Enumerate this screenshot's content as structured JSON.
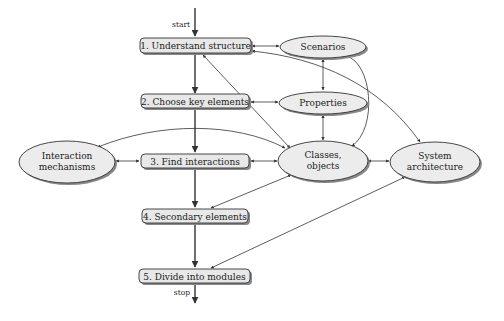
{
  "diagram": {
    "flow_labels": {
      "start": "start",
      "stop": "stop"
    },
    "steps": [
      {
        "id": "step1",
        "label": "1. Understand structure"
      },
      {
        "id": "step2",
        "label": "2. Choose key elements"
      },
      {
        "id": "step3",
        "label": "3. Find interactions"
      },
      {
        "id": "step4",
        "label": "4. Secondary elements"
      },
      {
        "id": "step5",
        "label": "5. Divide into modules"
      }
    ],
    "concepts": [
      {
        "id": "scenarios",
        "lines": [
          "Scenarios"
        ]
      },
      {
        "id": "properties",
        "lines": [
          "Properties"
        ]
      },
      {
        "id": "classes",
        "lines": [
          "Classes,",
          "objects"
        ]
      },
      {
        "id": "system",
        "lines": [
          "System",
          "architecture"
        ]
      },
      {
        "id": "interaction",
        "lines": [
          "Interaction",
          "mechanisms"
        ]
      }
    ],
    "edges": [
      {
        "from": "start",
        "to": "step1",
        "type": "main"
      },
      {
        "from": "step1",
        "to": "step2",
        "type": "main"
      },
      {
        "from": "step2",
        "to": "step3",
        "type": "main"
      },
      {
        "from": "step3",
        "to": "step4",
        "type": "main"
      },
      {
        "from": "step4",
        "to": "step5",
        "type": "main"
      },
      {
        "from": "step5",
        "to": "stop",
        "type": "main"
      },
      {
        "from": "step1",
        "to": "scenarios",
        "type": "bidirectional"
      },
      {
        "from": "step2",
        "to": "properties",
        "type": "bidirectional"
      },
      {
        "from": "step3",
        "to": "classes",
        "type": "bidirectional"
      },
      {
        "from": "interaction",
        "to": "step3",
        "type": "bidirectional"
      },
      {
        "from": "scenarios",
        "to": "properties",
        "type": "bidirectional"
      },
      {
        "from": "properties",
        "to": "classes",
        "type": "bidirectional"
      },
      {
        "from": "scenarios",
        "to": "classes",
        "type": "bidirectional-curve"
      },
      {
        "from": "step1",
        "to": "classes",
        "type": "bidirectional"
      },
      {
        "from": "step1",
        "to": "system",
        "type": "bidirectional-curve"
      },
      {
        "from": "interaction",
        "to": "classes",
        "type": "bidirectional-curve"
      },
      {
        "from": "classes",
        "to": "system",
        "type": "bidirectional"
      },
      {
        "from": "classes",
        "to": "step4",
        "type": "bidirectional"
      },
      {
        "from": "system",
        "to": "step5",
        "type": "bidirectional"
      }
    ]
  }
}
